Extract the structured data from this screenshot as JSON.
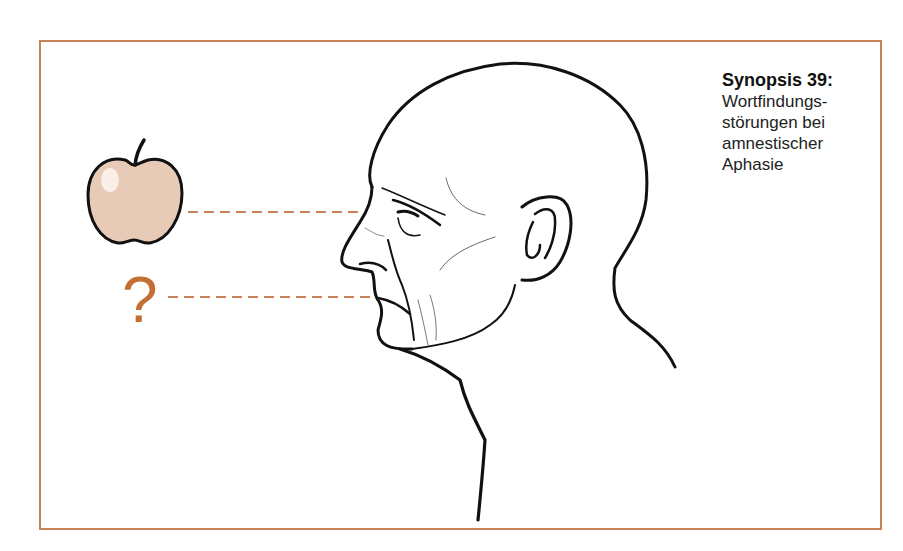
{
  "caption": {
    "title": "Synopsis 39:",
    "lines": [
      "Wortfindungs-",
      "störungen bei",
      "amnestischer",
      "Aphasie"
    ]
  },
  "illustration": {
    "object_label": "apple",
    "unknown_word_symbol": "?",
    "subject": "bald-man-profile-head"
  },
  "colors": {
    "frame": "#c8825a",
    "dashed_line": "#c8825a",
    "question_mark": "#c36f34",
    "apple_fill": "#e8cbb7",
    "line_art": "#111111"
  }
}
